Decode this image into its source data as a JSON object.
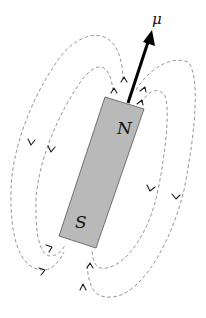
{
  "diagram": {
    "labels": {
      "north_pole": "N",
      "south_pole": "S",
      "moment": "μ"
    },
    "colors": {
      "magnet_fill": "#b9b9b9",
      "magnet_border": "#555555",
      "field_lines": "#8a8a8a",
      "arrow": "#000000",
      "background": "#ffffff"
    },
    "elements": {
      "magnet": {
        "shape": "tilted rectangle",
        "tilt": "about 17° clockwise from vertical"
      },
      "moment_vector": {
        "direction": "out of N pole, up and to the right"
      },
      "field_lines": {
        "count": 4,
        "left_side": 2,
        "right_side": 2,
        "style": "dashed",
        "direction": "leave N pole, loop around, enter S pole"
      }
    }
  }
}
